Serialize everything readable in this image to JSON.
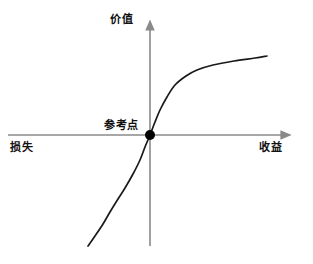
{
  "figure": {
    "title": "",
    "background_color": "#ffffff",
    "width": 313,
    "height": 264
  },
  "labels": {
    "y_axis": "价值",
    "x_axis_left": "损失",
    "x_axis_right": "收益",
    "reference_point": "参考点"
  },
  "colors": {
    "axis": "#8a8a8a",
    "curve": "#1a1a1a",
    "reference_dot": "#000000",
    "text": "#111111",
    "background": "#ffffff"
  },
  "chart_data": {
    "type": "line",
    "title": "",
    "subtitle": "",
    "xlabel": "收益",
    "ylabel": "价值",
    "xlabel_negative": "损失",
    "grid": false,
    "legend": null,
    "legend_position": "none",
    "axes": {
      "origin_label": "参考点",
      "origin_px": [
        150,
        135
      ],
      "x_axis_y_px": 135,
      "y_axis_x_px": 150,
      "x_axis_extent_px": [
        8,
        296
      ],
      "y_axis_extent_px": [
        15,
        246
      ],
      "x_arrow": "right",
      "y_arrow": "up",
      "x_ticks": [],
      "y_ticks": [],
      "xlim": [
        -1,
        1
      ],
      "ylim": [
        -1,
        1
      ]
    },
    "annotations": [
      {
        "text": "参考点",
        "x": 0,
        "y": 0,
        "marker": "filled-circle",
        "marker_radius_px": 5
      }
    ],
    "series": [
      {
        "name": "价值函数",
        "description": "Prospect theory S-shaped value function: concave over gains, convex and steeper over losses",
        "color": "#1a1a1a",
        "x": [
          -0.62,
          -0.55,
          -0.47,
          -0.4,
          -0.32,
          -0.25,
          -0.17,
          -0.1,
          -0.05,
          0.0,
          0.05,
          0.1,
          0.17,
          0.25,
          0.35,
          0.45,
          0.6,
          0.8,
          1.0,
          1.15
        ],
        "y": [
          -1.1,
          -0.95,
          -0.8,
          -0.66,
          -0.52,
          -0.4,
          -0.27,
          -0.16,
          -0.08,
          0.0,
          0.12,
          0.24,
          0.38,
          0.52,
          0.63,
          0.69,
          0.74,
          0.78,
          0.8,
          0.82
        ],
        "points_px": [
          [
            88,
            246
          ],
          [
            95,
            236
          ],
          [
            103,
            224
          ],
          [
            110,
            212
          ],
          [
            118,
            199
          ],
          [
            125,
            188
          ],
          [
            133,
            174
          ],
          [
            140,
            160
          ],
          [
            145,
            147
          ],
          [
            150,
            135
          ],
          [
            155,
            122
          ],
          [
            160,
            110
          ],
          [
            167,
            97
          ],
          [
            175,
            85
          ],
          [
            186,
            76
          ],
          [
            197,
            70
          ],
          [
            213,
            65
          ],
          [
            234,
            61
          ],
          [
            255,
            58
          ],
          [
            267,
            56
          ]
        ]
      }
    ]
  }
}
